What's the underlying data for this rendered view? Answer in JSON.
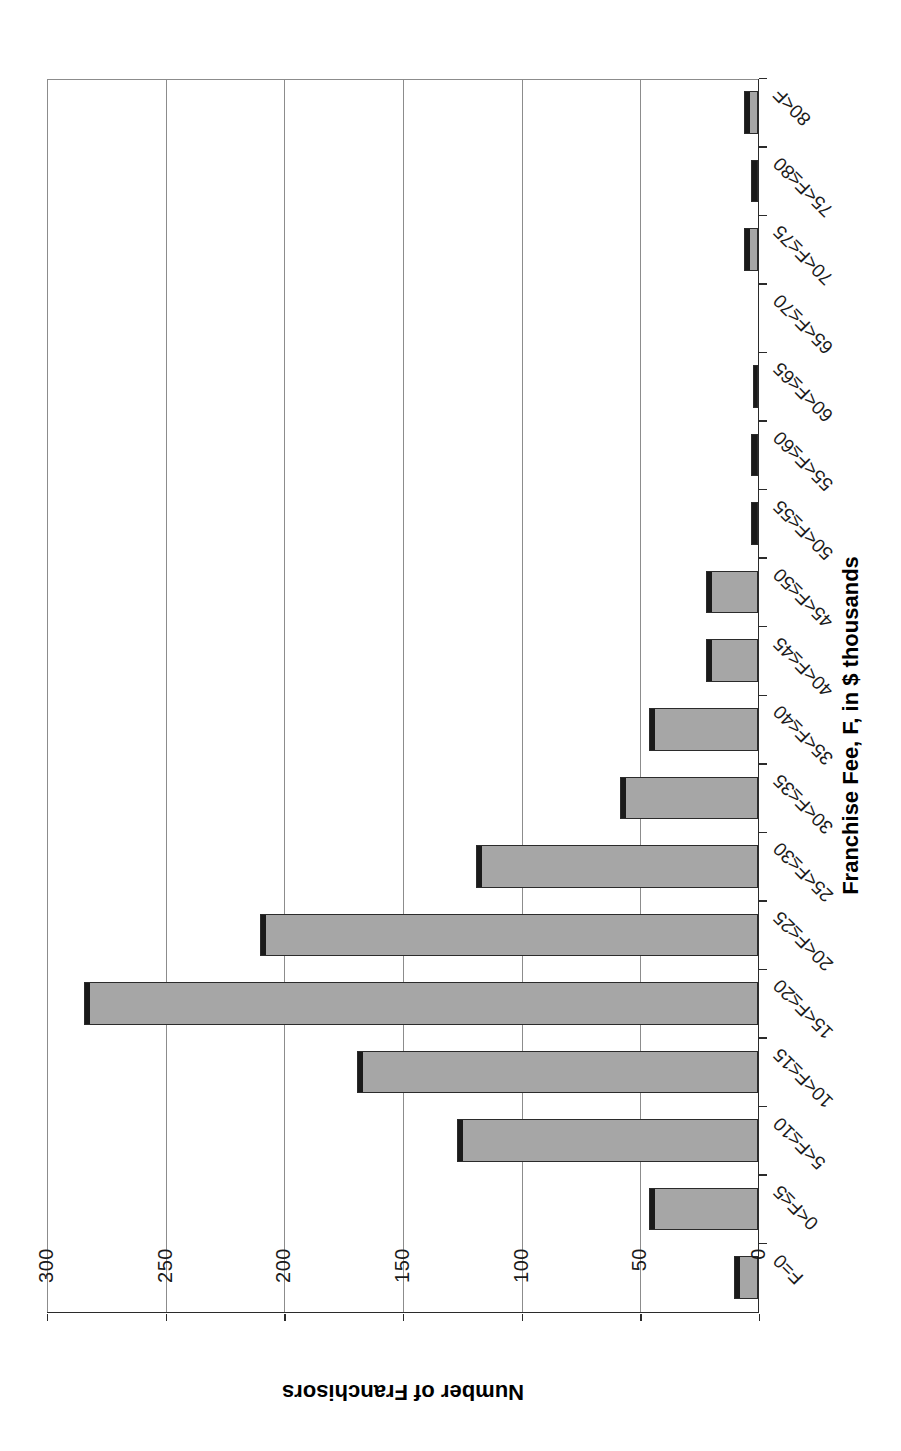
{
  "chart_data": {
    "type": "bar",
    "title": "",
    "xlabel": "Franchise Fee, F, in $ thousands",
    "ylabel": "Number of Franchisors",
    "orientation": "vertical",
    "grid": true,
    "legend": false,
    "ylim": [
      0,
      300
    ],
    "yticks": [
      0,
      50,
      100,
      150,
      200,
      250,
      300
    ],
    "ytick_labels": [
      "0",
      "50",
      "100",
      "150",
      "200",
      "250",
      "300"
    ],
    "categories": [
      "F=0",
      "0<F≤5",
      "5<F≤10",
      "10<F≤15",
      "15<F≤20",
      "20<F≤25",
      "25<F≤30",
      "30<F≤35",
      "35<F≤40",
      "40<F≤45",
      "45<F≤50",
      "50<F≤55",
      "55<F≤60",
      "60<F≤65",
      "65<F≤70",
      "70<F≤75",
      "75<F≤80",
      "80<F"
    ],
    "values": [
      10,
      46,
      127,
      169,
      284,
      210,
      119,
      58,
      46,
      22,
      22,
      3,
      3,
      2,
      0,
      6,
      3,
      6
    ],
    "colors": {
      "bar_fill": "#a6a6a6",
      "bar_edge": "#2b2b2b",
      "bar_top_shadow": "#1a1a1a",
      "gridline": "#8c8c8c",
      "axis": "#2b2b2b",
      "text": "#1a1a1a",
      "background": "#ffffff"
    }
  },
  "page": {
    "rotation_degrees": 180,
    "note": ""
  }
}
